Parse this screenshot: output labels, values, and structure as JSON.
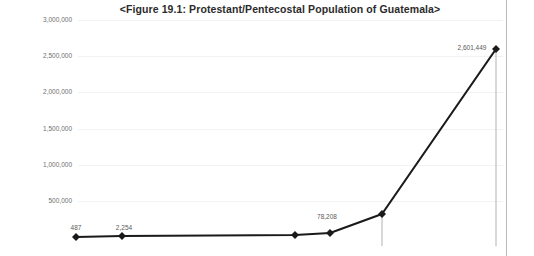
{
  "document": {
    "right_margin_rule_x": 506
  },
  "chart_data": {
    "type": "line",
    "title": "<Figure 19.1: Protestant/Pentecostal Population of Guatemala>",
    "xlabel": "",
    "ylabel": "",
    "ylim": [
      0,
      3000000
    ],
    "grid": true,
    "legend": "none",
    "marker": "diamond",
    "line_color": "#1a1a1a",
    "gridline_color": "#f2f2f2",
    "droplines": true,
    "y_ticks": [
      "3,000,000",
      "2,500,000",
      "2,000,000",
      "1,500,000",
      "1,000,000",
      "500,000"
    ],
    "y_tick_values": [
      3000000,
      2500000,
      2000000,
      1500000,
      1000000,
      500000
    ],
    "categories": [
      "1",
      "2",
      "3",
      "4",
      "5",
      "6"
    ],
    "values": [
      487,
      2254,
      20000,
      78208,
      420000,
      2601449
    ],
    "point_labels": [
      "487",
      "2,254",
      "",
      "78,208",
      "",
      "2,601,449"
    ],
    "points": [
      {
        "label": "487",
        "x": 76,
        "y": 237,
        "label_x": 76,
        "label_y": 224,
        "dropline": false
      },
      {
        "label": "2,254",
        "x": 122,
        "y": 236,
        "label_x": 124,
        "label_y": 224,
        "dropline": false
      },
      {
        "label": "",
        "x": 295,
        "y": 235,
        "label_x": 295,
        "label_y": 224,
        "dropline": false
      },
      {
        "label": "78,208",
        "x": 330,
        "y": 233,
        "label_x": 327,
        "label_y": 213,
        "dropline": false
      },
      {
        "label": "",
        "x": 382,
        "y": 214,
        "label_x": 382,
        "label_y": 203,
        "dropline": true
      },
      {
        "label": "2,601,449",
        "x": 496,
        "y": 49,
        "label_x": 472,
        "label_y": 44,
        "dropline": true
      }
    ]
  }
}
